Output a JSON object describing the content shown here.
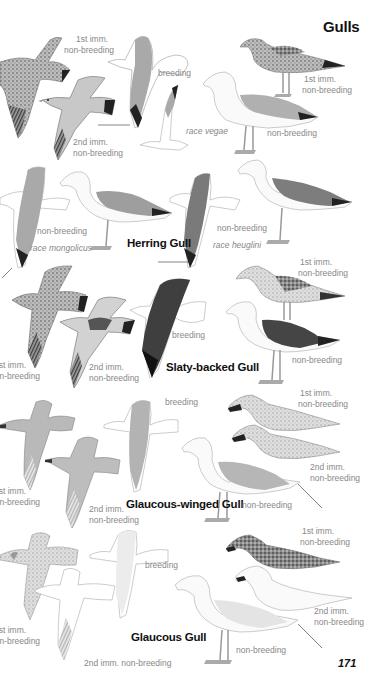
{
  "page": {
    "title": "Gulls",
    "page_number": "171"
  },
  "species": [
    {
      "name": "Herring Gull",
      "labels": {
        "flight_1st_imm": [
          "1st imm.",
          "non-breeding"
        ],
        "flight_2nd_imm": [
          "2nd imm.",
          "non-breeding"
        ],
        "flight_breeding": "breeding",
        "race_vegae": "race vegae",
        "perched_1st_imm": [
          "1st imm.",
          "non-breeding"
        ],
        "perched_nonbreeding": "non-breeding",
        "mongolicus_nonbreeding": "non-breeding",
        "race_mongolicus": "race mongolicus",
        "heuglini_nonbreeding": "non-breeding",
        "race_heuglini": "race heuglini"
      }
    },
    {
      "name": "Slaty-backed Gull",
      "labels": {
        "flight_1st_imm": [
          "1st imm.",
          "non-breeding"
        ],
        "flight_2nd_imm": [
          "2nd imm.",
          "non-breeding"
        ],
        "flight_breeding": "breeding",
        "perched_1st_imm": [
          "1st imm.",
          "non-breeding"
        ],
        "perched_nonbreeding": "non-breeding"
      }
    },
    {
      "name": "Glaucous-winged Gull",
      "labels": {
        "flight_1st_imm": [
          "1st imm.",
          "non-breeding"
        ],
        "flight_2nd_imm": [
          "2nd imm.",
          "non-breeding"
        ],
        "flight_breeding": "breeding",
        "perched_1st_imm": [
          "1st imm.",
          "non-breeding"
        ],
        "perched_2nd_imm": [
          "2nd imm.",
          "non-breeding"
        ],
        "perched_nonbreeding": "non-breeding"
      }
    },
    {
      "name": "Glaucous Gull",
      "labels": {
        "flight_1st_imm": [
          "1st imm.",
          "non-breeding"
        ],
        "flight_2nd_imm": "2nd imm. non-breeding",
        "flight_breeding": "breeding",
        "perched_1st_imm": [
          "1st imm.",
          "non-breeding"
        ],
        "perched_2nd_imm": [
          "2nd imm.",
          "non-breeding"
        ],
        "perched_nonbreeding": "non-breeding"
      }
    }
  ],
  "colors": {
    "text_dark": "#111111",
    "label_gray": "#888888",
    "mantle_herring": "#a9a9a9",
    "mantle_slaty": "#4a4a4a",
    "mantle_glaucous_winged": "#b5b5b5",
    "mantle_glaucous": "#e6e6e6"
  }
}
